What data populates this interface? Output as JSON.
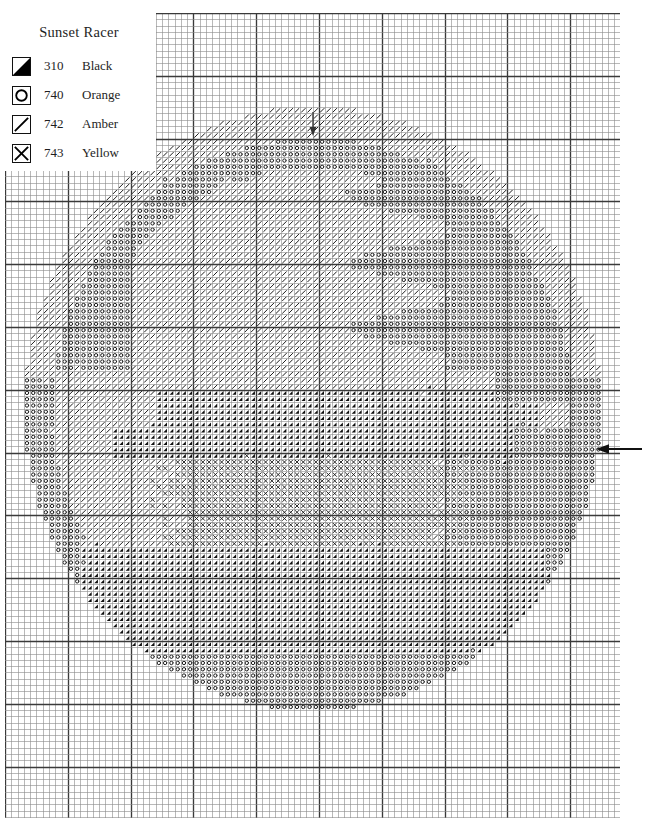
{
  "document": {
    "type": "cross-stitch-pattern-chart",
    "title": "Sunset Racer"
  },
  "legend": {
    "title": "Sunset Racer",
    "entries": [
      {
        "symbol": "filled-triangle",
        "code": "310",
        "name": "Black",
        "color": "#000000"
      },
      {
        "symbol": "circle",
        "code": "740",
        "name": "Orange",
        "color": "#000000"
      },
      {
        "symbol": "slash",
        "code": "742",
        "name": "Amber",
        "color": "#000000"
      },
      {
        "symbol": "cross",
        "code": "743",
        "name": "Yellow",
        "color": "#000000"
      }
    ]
  },
  "markers": [
    {
      "name": "top-center-marker",
      "icon": "arrow-down-icon",
      "axis": "horizontal",
      "cell": 49
    },
    {
      "name": "right-center-marker",
      "icon": "arrow-left-icon",
      "axis": "vertical",
      "cell": 68
    }
  ],
  "grid": {
    "columns": 98,
    "rows": 129,
    "cell_px": 6.28,
    "minor_line_color": "#8a8a8a",
    "major_line_color": "#3a3a3a",
    "major_every": 10,
    "origin_x": 5,
    "origin_y": 13,
    "background": "#ffffff"
  },
  "chart_data": {
    "type": "heatmap",
    "title": "Sunset Racer",
    "xlabel": "",
    "ylabel": "",
    "legend_position": "top-left",
    "grid": true,
    "palette": {
      "0": "empty",
      "1": "310 Black",
      "2": "740 Orange",
      "3": "742 Amber",
      "4": "743 Yellow"
    },
    "categories": [
      "310 Black",
      "740 Orange",
      "742 Amber",
      "743 Yellow"
    ],
    "values": [
      1,
      2,
      3,
      4
    ],
    "shape_regions": [
      {
        "symbol": 3,
        "name": "hat-crown-highlight",
        "desc": "amber slash fill across the upper crown and brim of the hat"
      },
      {
        "symbol": 2,
        "name": "hat-shadow",
        "desc": "orange circle fill on the right crown, brim underside and lower body"
      },
      {
        "symbol": 1,
        "name": "racer-silhouette",
        "desc": "black triangle fill forming the central car/racer band and lower shadow band"
      },
      {
        "symbol": 4,
        "name": "sunset-glow",
        "desc": "yellow cross fill in the lower middle region beneath the racer"
      }
    ],
    "ellipse": {
      "cx": 49,
      "cy": 63,
      "rx": 46,
      "ry": 48
    }
  }
}
